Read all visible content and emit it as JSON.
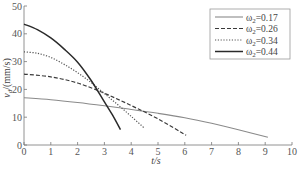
{
  "chart_data": {
    "type": "line",
    "title": "",
    "xlabel": "t/s",
    "ylabel": "v_d/(mm/s)",
    "ylabel_main": "v",
    "ylabel_sub": "d",
    "ylabel_rest": "/(mm/s)",
    "xlim": [
      0,
      10
    ],
    "ylim": [
      0,
      50
    ],
    "xticks": [
      0,
      1,
      2,
      3,
      4,
      5,
      6,
      7,
      8,
      9,
      10
    ],
    "yticks": [
      0,
      10,
      20,
      30,
      40,
      50
    ],
    "grid": false,
    "legend_position": "top-right",
    "series": [
      {
        "name": "ω2=0.17",
        "label_main": "ω",
        "label_sub": "2",
        "label_rest": "=0.17",
        "style": "solid",
        "color": "#8a8a8a",
        "x": [
          0,
          1,
          2,
          3,
          4,
          5,
          6,
          7,
          8,
          9.1
        ],
        "y": [
          17,
          16.3,
          15.3,
          14.1,
          12.8,
          11.4,
          9.8,
          7.8,
          5.5,
          2.8
        ]
      },
      {
        "name": "ω2=0.26",
        "label_main": "ω",
        "label_sub": "2",
        "label_rest": "=0.26",
        "style": "dashed",
        "color": "#3a3a3a",
        "x": [
          0,
          1,
          2,
          3,
          4,
          5,
          6.05
        ],
        "y": [
          25.5,
          24.5,
          22.3,
          18.6,
          14.2,
          9.4,
          3.5
        ]
      },
      {
        "name": "ω2=0.34",
        "label_main": "ω",
        "label_sub": "2",
        "label_rest": "=0.34",
        "style": "dotted",
        "color": "#555555",
        "x": [
          0,
          0.5,
          1,
          1.5,
          2,
          2.5,
          3,
          3.5,
          4,
          4.5
        ],
        "y": [
          33.5,
          33,
          31.5,
          29,
          26,
          22.5,
          18.5,
          14.5,
          10.3,
          6
        ]
      },
      {
        "name": "ω2=0.44",
        "label_main": "ω",
        "label_sub": "2",
        "label_rest": "=0.44",
        "style": "solid",
        "color": "#2a2a2a",
        "x": [
          0,
          0.5,
          1,
          1.5,
          2,
          2.5,
          3,
          3.3,
          3.6
        ],
        "y": [
          43.5,
          41.5,
          38.5,
          34.5,
          29.8,
          23.3,
          15.5,
          10.8,
          5.5
        ]
      }
    ]
  }
}
